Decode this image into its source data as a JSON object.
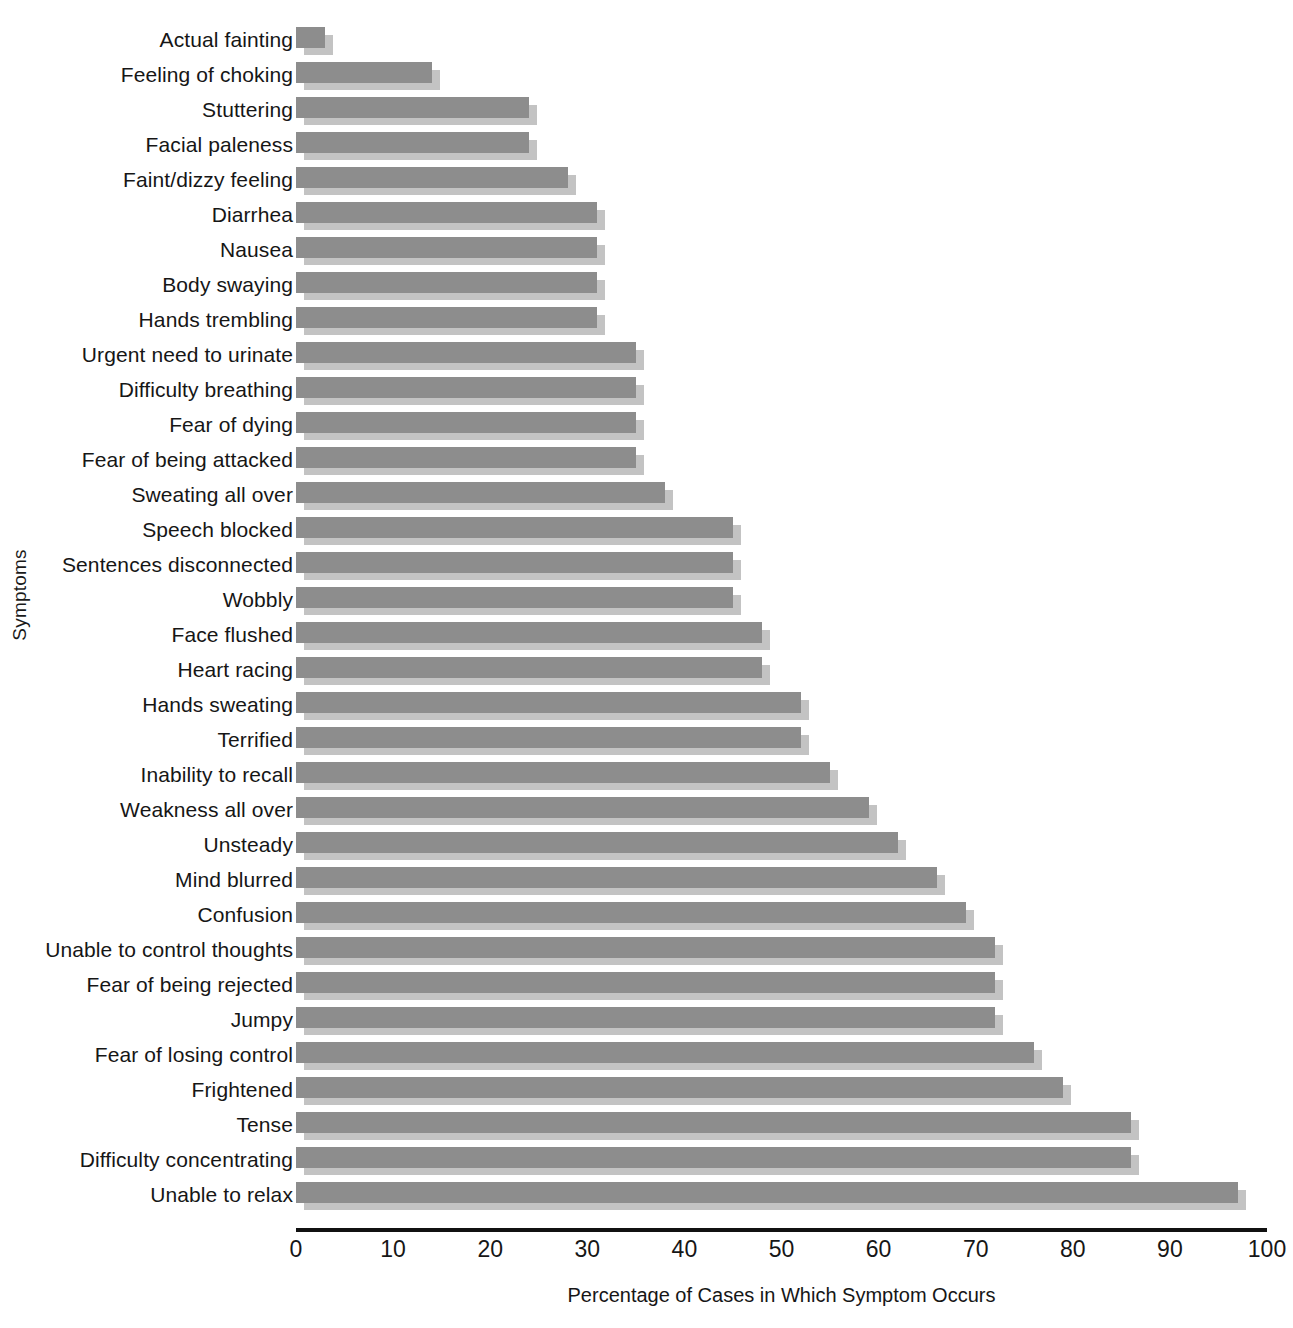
{
  "chart_data": {
    "type": "bar",
    "orientation": "horizontal",
    "title": "",
    "xlabel": "Percentage of Cases in Which Symptom Occurs",
    "ylabel": "Symptoms",
    "xlim": [
      0,
      100
    ],
    "xticks": [
      0,
      10,
      20,
      30,
      40,
      50,
      60,
      70,
      80,
      90,
      100
    ],
    "grid": false,
    "legend": null,
    "bar_color": "#8d8d8d",
    "shadow_color": "#c3c3c3",
    "categories": [
      "Actual fainting",
      "Feeling of choking",
      "Stuttering",
      "Facial paleness",
      "Faint/dizzy feeling",
      "Diarrhea",
      "Nausea",
      "Body swaying",
      "Hands trembling",
      "Urgent need to urinate",
      "Difficulty breathing",
      "Fear of dying",
      "Fear of being attacked",
      "Sweating all over",
      "Speech blocked",
      "Sentences disconnected",
      "Wobbly",
      "Face flushed",
      "Heart racing",
      "Hands sweating",
      "Terrified",
      "Inability to recall",
      "Weakness all over",
      "Unsteady",
      "Mind blurred",
      "Confusion",
      "Unable to control thoughts",
      "Fear of being rejected",
      "Jumpy",
      "Fear of losing control",
      "Frightened",
      "Tense",
      "Difficulty concentrating",
      "Unable to relax"
    ],
    "values": [
      3,
      14,
      24,
      24,
      28,
      31,
      31,
      31,
      31,
      35,
      35,
      35,
      35,
      38,
      45,
      45,
      45,
      48,
      48,
      52,
      52,
      55,
      59,
      62,
      66,
      69,
      72,
      72,
      72,
      76,
      79,
      86,
      86,
      97
    ]
  }
}
